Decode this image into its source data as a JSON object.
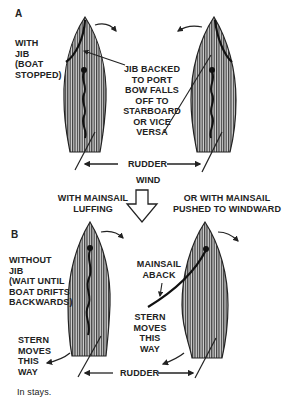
{
  "figure": {
    "caption": "In stays.",
    "colors": {
      "ink": "#222222",
      "hull_fill": "#9a9a9a",
      "background": "#ffffff"
    }
  },
  "panel_a": {
    "letter": "A",
    "side_label": "WITH\nJIB\n(BOAT\nSTOPPED)",
    "callout": "JIB BACKED\nTO PORT\nBOW FALLS\nOFF TO\nSTARBOARD\nOR VICE\nVERSA",
    "rudder_label": "RUDDER",
    "wind_label": "WIND"
  },
  "center": {
    "left_caption": "WITH MAINSAIL\nLUFFING",
    "right_caption": "OR WITH MAINSAIL\nPUSHED TO WINDWARD",
    "wind_arrow_icon": "down-arrow-outline"
  },
  "panel_b": {
    "letter": "B",
    "side_label": "WITHOUT\nJIB\n(WAIT UNTIL\nBOAT DRIFTS\nBACKWARDS)",
    "mainsail_label": "MAINSAIL\nABACK",
    "stern_left": "STERN\nMOVES\nTHIS\nWAY",
    "stern_right": "STERN\nMOVES\nTHIS\nWAY",
    "rudder_label": "RUDDER"
  }
}
